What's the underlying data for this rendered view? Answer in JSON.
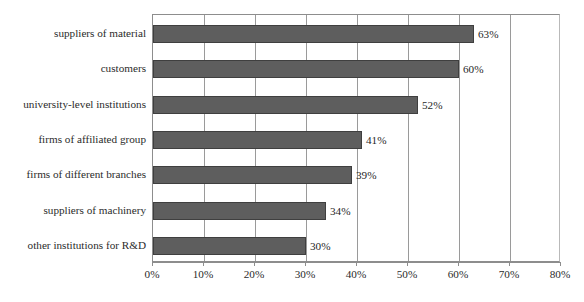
{
  "chart_data": {
    "type": "bar",
    "orientation": "horizontal",
    "title": "",
    "subtitle": "",
    "xlabel": "",
    "ylabel": "",
    "xlim": [
      0,
      80
    ],
    "xtick_labels": [
      "0%",
      "10%",
      "20%",
      "30%",
      "40%",
      "50%",
      "60%",
      "70%",
      "80%"
    ],
    "xticks": [
      0,
      10,
      20,
      30,
      40,
      50,
      60,
      70,
      80
    ],
    "grid": "vertical-only",
    "legend": "none",
    "categories": [
      "suppliers of material",
      "customers",
      "university-level institutions",
      "firms of affiliated group",
      "firms of different branches",
      "suppliers of machinery",
      "other institutions for R&D"
    ],
    "values": [
      63,
      60,
      52,
      41,
      39,
      34,
      30
    ],
    "value_labels": [
      "63%",
      "60%",
      "52%",
      "41%",
      "39%",
      "34%",
      "30%"
    ],
    "bar_color": "#5e5e5e",
    "bar_edge_color": "#3f3f3f",
    "gridline_color": "#9a9a9a",
    "axis_color": "#8d8d8d"
  },
  "caption": {
    "text": ""
  }
}
